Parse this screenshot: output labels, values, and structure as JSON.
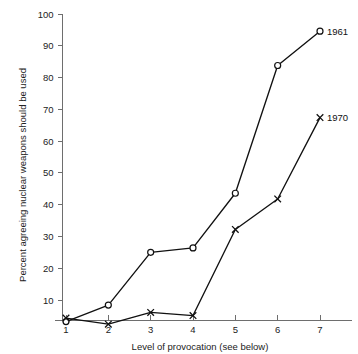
{
  "chart_data": {
    "type": "line",
    "title": "",
    "xlabel": "Level of provocation (see below)",
    "ylabel": "Percent agreeing nuclear weapons should be used",
    "x": [
      1,
      2,
      3,
      4,
      5,
      6,
      7
    ],
    "xtick_labels": [
      "1",
      "2",
      "3",
      "4",
      "5",
      "6",
      "7"
    ],
    "ytick_labels": [
      "10",
      "20",
      "30",
      "40",
      "50",
      "60",
      "70",
      "80",
      "90",
      "100"
    ],
    "ytick_values": [
      10,
      20,
      30,
      40,
      50,
      60,
      70,
      80,
      90,
      100
    ],
    "ylim": [
      0,
      100
    ],
    "xlim": [
      0.55,
      7.55
    ],
    "grid": false,
    "legend_position": "inline-right-end",
    "series": [
      {
        "name": "1961",
        "label": "1961",
        "marker": "open-circle",
        "color": "#111111",
        "values": [
          3.2,
          8.4,
          25.0,
          26.4,
          43.6,
          83.8,
          94.6
        ]
      },
      {
        "name": "1970",
        "label": "1970",
        "marker": "cross",
        "color": "#111111",
        "values": [
          4.3,
          2.4,
          6.1,
          5.1,
          32.2,
          41.8,
          67.4
        ]
      }
    ]
  },
  "axes": {
    "y_axis_name": "percent-axis",
    "x_axis_name": "provocation-axis"
  }
}
